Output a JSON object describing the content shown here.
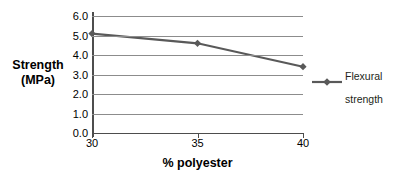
{
  "chart_data": {
    "type": "line",
    "title": "",
    "xlabel": "% polyester",
    "ylabel": "Strength\n(MPa)",
    "ylabel_line1": "Strength",
    "ylabel_line2": "(MPa)",
    "x": [
      30,
      35,
      40
    ],
    "xtick_labels": [
      "30",
      "35",
      "40"
    ],
    "ytick_labels": [
      "0.0",
      "1.0",
      "2.0",
      "3.0",
      "4.0",
      "5.0",
      "6.0"
    ],
    "ytick_values": [
      0.0,
      1.0,
      2.0,
      3.0,
      4.0,
      5.0,
      6.0
    ],
    "xlim": [
      30,
      40
    ],
    "ylim": [
      0.0,
      6.0
    ],
    "grid": true,
    "legend_position": "right",
    "series": [
      {
        "name": "Flexural strength",
        "name_line1": "Flexural",
        "name_line2": "strength",
        "values": [
          5.1,
          4.6,
          3.4
        ],
        "color": "#595959",
        "marker": "diamond"
      }
    ],
    "colors": {
      "series_line": "#595959",
      "gridline": "#8c8c8c",
      "axis": "#4d4d4d",
      "text": "#000000",
      "legend_text": "#231f20",
      "background": "#ffffff"
    }
  }
}
